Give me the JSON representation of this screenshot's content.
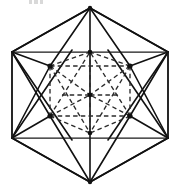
{
  "figure": {
    "canvas": {
      "width": 181,
      "height": 190,
      "background": "#ffffff"
    },
    "colors": {
      "solid_stroke": "#111111",
      "hidden_stroke": "#2b2b2b",
      "hidden_faint_stroke": "#555555",
      "vertex_fill": "#111111",
      "background": "#ffffff"
    },
    "style": {
      "solid_width": 1.6,
      "hidden_width": 1.35,
      "hidden_dash": "4.5 3.2"
    },
    "outer_hexagon": {
      "label": "outer-hexagon",
      "points": "90,8 168,52 168,138 90,182 12,138 12,52",
      "vertices": [
        {
          "name": "top",
          "x": 90,
          "y": 8
        },
        {
          "name": "upper-right",
          "x": 168,
          "y": 52
        },
        {
          "name": "lower-right",
          "x": 168,
          "y": 138
        },
        {
          "name": "bottom",
          "x": 90,
          "y": 182
        },
        {
          "name": "lower-left",
          "x": 12,
          "y": 138
        },
        {
          "name": "upper-left",
          "x": 12,
          "y": 52
        }
      ]
    },
    "inner_square": {
      "label": "inscribed-square",
      "points": "12,52 168,52 168,138 12,138"
    },
    "solid_edges": [
      {
        "name": "top-to-upper-left",
        "d": "M 90 8 L 12 52"
      },
      {
        "name": "top-to-upper-right",
        "d": "M 90 8 L 168 52"
      },
      {
        "name": "top-to-inner-left",
        "d": "M 90 8 L 50 66"
      },
      {
        "name": "top-to-inner-right",
        "d": "M 90 8 L 130 66"
      },
      {
        "name": "top-to-center-vertical",
        "d": "M 90 8 L 90 182"
      },
      {
        "name": "bottom-to-lower-left",
        "d": "M 90 182 L 12 138"
      },
      {
        "name": "bottom-to-lower-right",
        "d": "M 90 182 L 168 138"
      },
      {
        "name": "bottom-to-inner-left",
        "d": "M 90 182 L 50 116"
      },
      {
        "name": "bottom-to-inner-right",
        "d": "M 90 182 L 130 116"
      },
      {
        "name": "upper-left-to-inner-left",
        "d": "M 12 52 L 50 66"
      },
      {
        "name": "upper-left-to-inner-lower-left",
        "d": "M 12 52 L 50 116"
      },
      {
        "name": "upper-left-to-bottom-span",
        "d": "M 12 52 L 72 140"
      },
      {
        "name": "upper-right-to-inner-right",
        "d": "M 168 52 L 130 66"
      },
      {
        "name": "upper-right-to-inner-lower-right",
        "d": "M 168 52 L 130 116"
      },
      {
        "name": "upper-right-to-bottom-span",
        "d": "M 168 52 L 108 140"
      },
      {
        "name": "lower-left-to-inner-lower-left",
        "d": "M 12 138 L 50 116"
      },
      {
        "name": "lower-left-to-inner-left",
        "d": "M 12 138 L 50 66"
      },
      {
        "name": "lower-left-to-top-span",
        "d": "M 12 138 L 72 50"
      },
      {
        "name": "lower-right-to-inner-lower-right",
        "d": "M 168 138 L 130 116"
      },
      {
        "name": "lower-right-to-inner-right",
        "d": "M 168 138 L 130 66"
      },
      {
        "name": "lower-right-to-top-span",
        "d": "M 168 138 L 108 50"
      }
    ],
    "hidden_edges": [
      {
        "name": "inner-left-to-inner-right-top",
        "d": "M 50 66 L 130 66"
      },
      {
        "name": "inner-left-to-inner-lower-left",
        "d": "M 50 66 L 50 116"
      },
      {
        "name": "inner-right-to-inner-lower-right",
        "d": "M 130 66 L 130 116"
      },
      {
        "name": "inner-lower-left-to-inner-lower-right",
        "d": "M 50 116 L 130 116"
      },
      {
        "name": "inner-left-to-top-node",
        "d": "M 50 66 L 90 52"
      },
      {
        "name": "inner-right-to-top-node",
        "d": "M 130 66 L 90 52"
      },
      {
        "name": "inner-lower-left-to-bottom-node",
        "d": "M 50 116 L 90 133"
      },
      {
        "name": "inner-lower-right-to-bottom-node",
        "d": "M 130 116 L 90 133"
      },
      {
        "name": "inner-left-to-bottom-node",
        "d": "M 50 66 L 90 133"
      },
      {
        "name": "inner-right-to-bottom-node",
        "d": "M 130 66 L 90 133"
      },
      {
        "name": "inner-lower-left-to-top-node",
        "d": "M 50 116 L 90 52"
      },
      {
        "name": "inner-lower-right-to-top-node",
        "d": "M 130 116 L 90 52"
      },
      {
        "name": "inner-left-to-center",
        "d": "M 50 66 L 90 95"
      },
      {
        "name": "inner-right-to-center",
        "d": "M 130 66 L 90 95"
      },
      {
        "name": "inner-lower-left-to-center",
        "d": "M 50 116 L 90 95"
      },
      {
        "name": "inner-lower-right-to-center",
        "d": "M 130 116 L 90 95"
      },
      {
        "name": "top-node-to-center",
        "d": "M 90 52 L 90 95"
      },
      {
        "name": "center-to-bottom-node",
        "d": "M 90 95 L 90 133"
      },
      {
        "name": "center-horizontal-left",
        "d": "M 62 95 L 90 95"
      },
      {
        "name": "center-horizontal-right",
        "d": "M 90 95 L 118 95"
      }
    ],
    "inner_nodes": [
      {
        "name": "inner-upper-left-node",
        "x": 50,
        "y": 66,
        "r": 2.6
      },
      {
        "name": "inner-upper-right-node",
        "x": 130,
        "y": 66,
        "r": 2.6
      },
      {
        "name": "inner-lower-left-node",
        "x": 50,
        "y": 116,
        "r": 2.6
      },
      {
        "name": "inner-lower-right-node",
        "x": 130,
        "y": 116,
        "r": 2.6
      },
      {
        "name": "inner-top-node",
        "x": 90,
        "y": 52,
        "r": 2.3
      },
      {
        "name": "inner-bottom-node",
        "x": 90,
        "y": 133,
        "r": 2.3
      },
      {
        "name": "inner-center-node",
        "x": 90,
        "y": 95,
        "r": 2.4
      }
    ],
    "outer_nodes": [
      {
        "name": "outer-top-vertex",
        "x": 90,
        "y": 8,
        "r": 2.2
      },
      {
        "name": "outer-bottom-vertex",
        "x": 90,
        "y": 182,
        "r": 2.2
      }
    ]
  }
}
